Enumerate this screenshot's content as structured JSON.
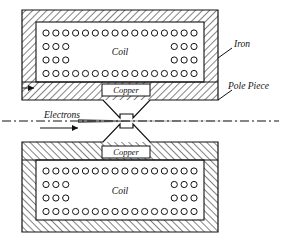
{
  "figure": {
    "background_color": "#ffffff",
    "line_color": "#111111",
    "hatch_color": "#222222"
  },
  "labels": {
    "coil_top": "Coil",
    "coil_bottom": "Coil",
    "copper_top": "Copper",
    "copper_bottom": "Copper",
    "iron": "Iron",
    "pole_piece": "Pole Piece",
    "electrons": "Electrons"
  },
  "coil": {
    "rows": [
      {
        "left_count": 16,
        "right_count": 0,
        "full_row": true
      },
      {
        "left_count": 3,
        "right_count": 3,
        "full_row": false
      },
      {
        "left_count": 3,
        "right_count": 3,
        "full_row": false
      },
      {
        "left_count": 16,
        "right_count": 0,
        "full_row": true
      }
    ],
    "circle_radius": 3.1,
    "circle_fill": "#ffffff",
    "circle_stroke": "#111111"
  },
  "geometry": {
    "iron_top": {
      "x": 22,
      "y": 10,
      "width": 196,
      "height": 90
    },
    "iron_bottom": {
      "x": 22,
      "y": 142,
      "width": 196,
      "height": 90
    },
    "coil_window_top": {
      "x": 36,
      "y": 22,
      "width": 168,
      "height": 60
    },
    "coil_window_bottom": {
      "x": 36,
      "y": 160,
      "width": 168,
      "height": 60
    },
    "copper_box_top": {
      "x": 102,
      "y": 84,
      "width": 48,
      "height": 12
    },
    "copper_box_bottom": {
      "x": 102,
      "y": 146,
      "width": 48,
      "height": 12
    },
    "axis_y": 121,
    "gap_center_x": 126,
    "gap_half_height": 7
  },
  "axis": {
    "style": "dash-dot",
    "label": "optical-axis"
  },
  "beam": {
    "description": "electron beam converging through pole gap",
    "direction": "left-to-right"
  }
}
